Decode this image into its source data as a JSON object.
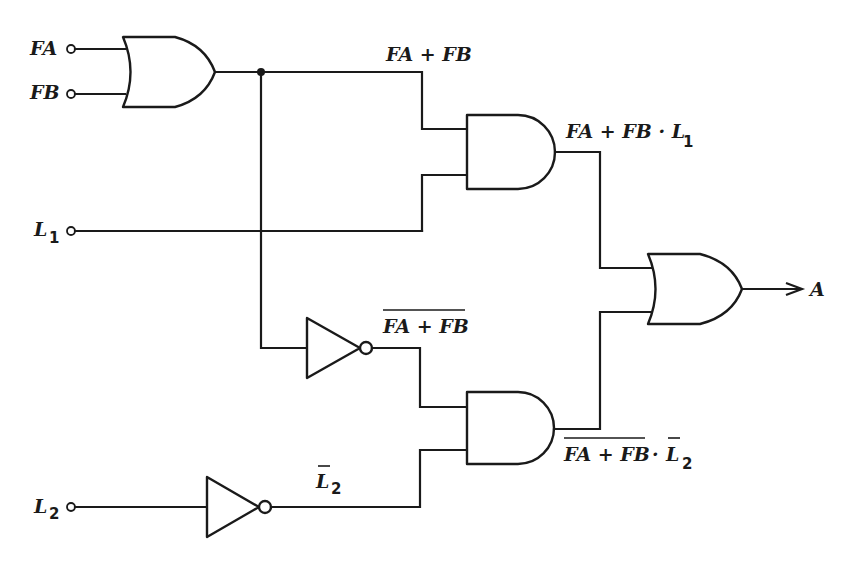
{
  "diagram": {
    "type": "logic-circuit",
    "inputs": {
      "fa": "FA",
      "fb": "FB",
      "l1": "L",
      "l1_sub": "1",
      "l2": "L",
      "l2_sub": "2"
    },
    "output": "A",
    "signals": {
      "or1_out": "FA + FB",
      "and1_out": "FA + FB · L",
      "and1_out_sub": "1",
      "not1_out": "FA + FB",
      "not2_out": "L",
      "not2_out_sub": "2",
      "and2_out_main": "FA + FB",
      "and2_out_dot": "·",
      "and2_out_l": "L",
      "and2_out_sub": "2"
    },
    "gates": [
      {
        "id": "or1",
        "type": "OR",
        "inputs": [
          "FA",
          "FB"
        ],
        "output": "FA + FB"
      },
      {
        "id": "and1",
        "type": "AND",
        "inputs": [
          "FA + FB",
          "L1"
        ],
        "output": "FA + FB · L1"
      },
      {
        "id": "not1",
        "type": "NOT",
        "inputs": [
          "FA + FB"
        ],
        "output": "NOT(FA + FB)"
      },
      {
        "id": "not2",
        "type": "NOT",
        "inputs": [
          "L2"
        ],
        "output": "NOT(L2)"
      },
      {
        "id": "and2",
        "type": "AND",
        "inputs": [
          "NOT(FA + FB)",
          "NOT(L2)"
        ],
        "output": "NOT(FA + FB) · NOT(L2)"
      },
      {
        "id": "or2",
        "type": "OR",
        "inputs": [
          "FA + FB · L1",
          "NOT(FA + FB) · NOT(L2)"
        ],
        "output": "A"
      }
    ],
    "colors": {
      "ink": "#1a1a1a",
      "background": "#ffffff"
    }
  }
}
